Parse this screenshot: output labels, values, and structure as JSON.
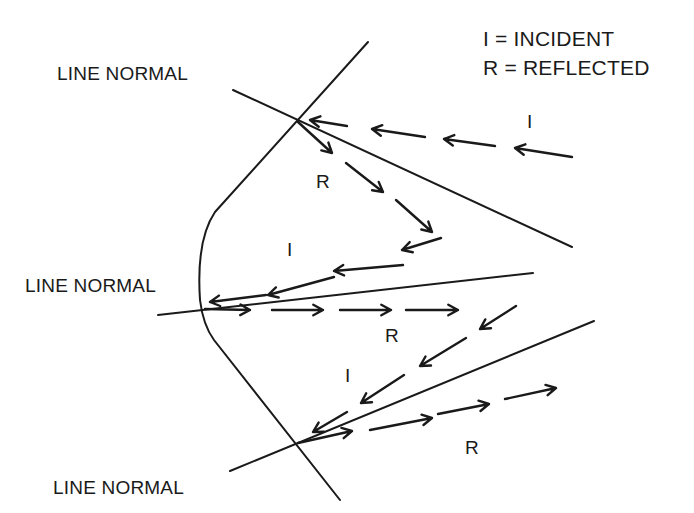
{
  "legend": {
    "incident": "I = INCIDENT",
    "reflected": "R = REFLECTED"
  },
  "labels": {
    "normal_top": "LINE NORMAL",
    "normal_middle": "LINE NORMAL",
    "normal_bottom": "LINE NORMAL",
    "incident_top": "I",
    "reflected_top": "R",
    "incident_middle": "I",
    "reflected_middle": "R",
    "incident_bottom": "I",
    "reflected_bottom": "R"
  },
  "colors": {
    "ink": "#1a1a1a",
    "background": "#ffffff"
  },
  "geometry": {
    "surface_path": "M368,42 L215,212 Q196,240 200,300 Q203,325 214,340 L340,500",
    "normals": [
      {
        "name": "normal-top",
        "x1": 233,
        "y1": 90,
        "x2": 572,
        "y2": 247
      },
      {
        "name": "normal-middle",
        "x1": 158,
        "y1": 315,
        "x2": 533,
        "y2": 273
      },
      {
        "name": "normal-bottom",
        "x1": 230,
        "y1": 471,
        "x2": 594,
        "y2": 321
      }
    ],
    "rays": [
      {
        "group": "incident-top",
        "segments": [
          [
            572,
            157,
            515,
            148
          ],
          [
            495,
            146,
            444,
            139
          ],
          [
            425,
            137,
            372,
            129
          ],
          [
            347,
            126,
            310,
            120
          ]
        ]
      },
      {
        "group": "reflected-top",
        "segments": [
          [
            298,
            122,
            332,
            153
          ],
          [
            346,
            163,
            383,
            192
          ],
          [
            396,
            200,
            432,
            232
          ]
        ]
      },
      {
        "group": "incident-middle",
        "segments": [
          [
            441,
            238,
            402,
            250
          ],
          [
            403,
            265,
            334,
            271
          ],
          [
            334,
            277,
            268,
            295
          ],
          [
            266,
            295,
            210,
            302
          ]
        ]
      },
      {
        "group": "reflected-middle",
        "segments": [
          [
            205,
            309,
            250,
            310
          ],
          [
            272,
            310,
            323,
            310
          ],
          [
            340,
            310,
            391,
            310
          ],
          [
            406,
            310,
            458,
            310
          ]
        ]
      },
      {
        "group": "incident-bottom",
        "segments": [
          [
            516,
            306,
            480,
            329
          ],
          [
            466,
            338,
            420,
            366
          ],
          [
            404,
            375,
            361,
            403
          ],
          [
            347,
            412,
            313,
            432
          ]
        ]
      },
      {
        "group": "reflected-bottom",
        "segments": [
          [
            298,
            443,
            352,
            431
          ],
          [
            370,
            430,
            432,
            418
          ],
          [
            438,
            414,
            489,
            404
          ],
          [
            505,
            399,
            556,
            388
          ]
        ]
      }
    ]
  }
}
